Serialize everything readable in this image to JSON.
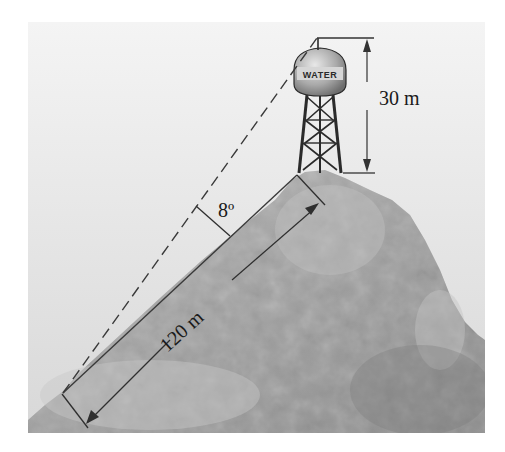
{
  "figure": {
    "tower_label": "WATER",
    "height_label": "30 m",
    "slope_label": "120 m",
    "angle_label": "8º"
  },
  "colors": {
    "sky_top": "#f2f2f2",
    "sky_bottom": "#dedede",
    "hill_light": "#b8b8b8",
    "hill_dark": "#8e8e8e",
    "line": "#333333"
  }
}
